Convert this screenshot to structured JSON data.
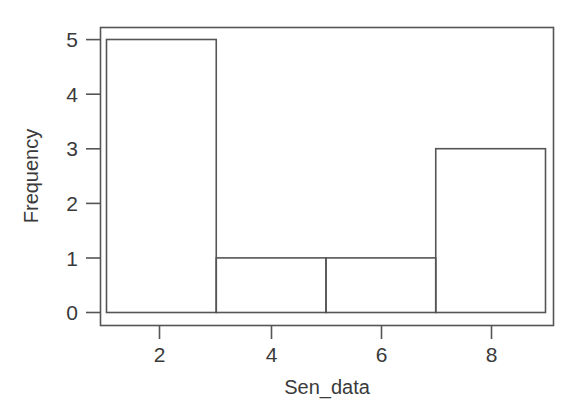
{
  "figure": {
    "background_color": "#ffffff",
    "line_color": "#555555",
    "text_color": "#3a3a3a"
  },
  "chart_data": {
    "type": "bar",
    "chart_variant": "histogram",
    "title": "",
    "subtitle": "",
    "xlabel": "Sen_data",
    "ylabel": "Frequency",
    "categories": [
      "1-3",
      "3-5",
      "5-7",
      "7-9"
    ],
    "bin_edges": [
      1,
      3,
      5,
      7,
      9
    ],
    "values": [
      5,
      1,
      1,
      3
    ],
    "bins": [
      {
        "label": "1-3",
        "x_start": 1,
        "x_end": 3,
        "frequency": 5
      },
      {
        "label": "3-5",
        "x_start": 3,
        "x_end": 5,
        "frequency": 1
      },
      {
        "label": "5-7",
        "x_start": 5,
        "x_end": 7,
        "frequency": 1
      },
      {
        "label": "7-9",
        "x_start": 7,
        "x_end": 9,
        "frequency": 3
      }
    ],
    "xlim": [
      0.85,
      9.3
    ],
    "ylim": [
      -0.12,
      5.25
    ],
    "x_ticks": [
      2,
      4,
      6,
      8
    ],
    "x_tick_labels": [
      "2",
      "4",
      "6",
      "8"
    ],
    "y_ticks": [
      0,
      1,
      2,
      3,
      4,
      5
    ],
    "y_tick_labels": [
      "0",
      "1",
      "2",
      "3",
      "4",
      "5"
    ],
    "grid": false,
    "legend": false,
    "legend_position": "none",
    "bar_fill": "none",
    "bar_stroke": "#555555",
    "total_count": 10
  },
  "axis": {
    "x_label": "Sen_data",
    "y_label": "Frequency",
    "x_tick_labels": [
      "2",
      "4",
      "6",
      "8"
    ],
    "y_tick_labels": [
      "0",
      "1",
      "2",
      "3",
      "4",
      "5"
    ]
  }
}
